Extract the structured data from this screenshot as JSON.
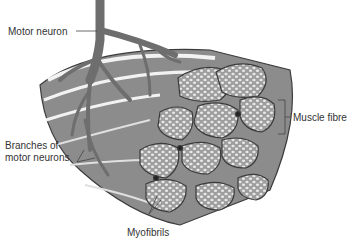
{
  "figure": {
    "style": "grayscale illustration",
    "colors": {
      "background": "#ffffff",
      "neuron": "#7a7a7a",
      "fibre_fill": "#9a9a9a",
      "fibre_outline": "#3c3c3c",
      "myofibril": "#e6e6e6",
      "label_text": "#333333"
    }
  },
  "labels": {
    "motor_neuron": "Motor neuron",
    "muscle_fibre": "Muscle fibre",
    "branches_line1": "Branches of",
    "branches_line2": "motor neurons",
    "myofibrils": "Myofibrils"
  }
}
